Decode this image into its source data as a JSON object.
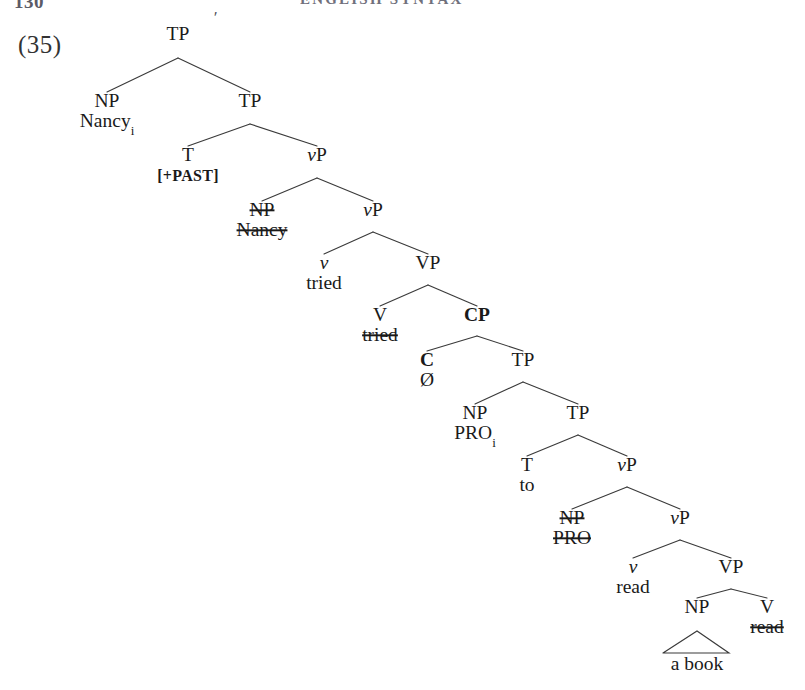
{
  "page": {
    "folio": "130",
    "running_title": "ENGLISH SYNTAX",
    "example_number": "(35)",
    "stray_mark": "'"
  },
  "tree": {
    "type": "syntax-tree",
    "description": "X-bar phrase structure tree for 'Nancy tried to read a book' with control PRO",
    "nodes": [
      {
        "id": "tp-root",
        "label": "TP",
        "sub": "",
        "gloss": "",
        "x": 178,
        "y": 40,
        "style": "plain"
      },
      {
        "id": "np-subj",
        "label": "NP",
        "sub": "",
        "gloss": "Nancy",
        "gloss_sub": "i",
        "x": 107,
        "y": 107,
        "style": "plain"
      },
      {
        "id": "tp-2",
        "label": "TP",
        "sub": "",
        "gloss": "",
        "x": 250,
        "y": 107,
        "style": "plain"
      },
      {
        "id": "t-past",
        "label": "T",
        "sub": "",
        "gloss": "[+PAST]",
        "x": 188,
        "y": 161,
        "style": "plain",
        "gloss_style": "smallcaps"
      },
      {
        "id": "vp-1",
        "label": "vP",
        "sub": "",
        "gloss": "",
        "x": 317,
        "y": 161,
        "style": "little-v"
      },
      {
        "id": "np-trace-1",
        "label": "NP",
        "sub": "",
        "gloss": "Nancy",
        "x": 262,
        "y": 216,
        "style": "struck",
        "gloss_style": "struck"
      },
      {
        "id": "vp-2",
        "label": "vP",
        "sub": "",
        "gloss": "",
        "x": 373,
        "y": 216,
        "style": "little-v"
      },
      {
        "id": "v-tried",
        "label": "v",
        "sub": "",
        "gloss": "tried",
        "x": 324,
        "y": 269,
        "style": "ital"
      },
      {
        "id": "vp-big",
        "label": "VP",
        "sub": "",
        "gloss": "",
        "x": 428,
        "y": 269,
        "style": "plain"
      },
      {
        "id": "v-trace",
        "label": "V",
        "sub": "",
        "gloss": "tried",
        "x": 380,
        "y": 321,
        "style": "plain",
        "gloss_style": "struck"
      },
      {
        "id": "cp",
        "label": "CP",
        "sub": "",
        "gloss": "",
        "x": 477,
        "y": 321,
        "style": "bold"
      },
      {
        "id": "c-null",
        "label": "C",
        "sub": "",
        "gloss": "Ø",
        "x": 427,
        "y": 366,
        "style": "bold"
      },
      {
        "id": "tp-3",
        "label": "TP",
        "sub": "",
        "gloss": "",
        "x": 523,
        "y": 366,
        "style": "plain"
      },
      {
        "id": "np-pro",
        "label": "NP",
        "sub": "",
        "gloss": "PRO",
        "gloss_sub": "i",
        "x": 475,
        "y": 419,
        "style": "plain"
      },
      {
        "id": "tp-4",
        "label": "TP",
        "sub": "",
        "gloss": "",
        "x": 578,
        "y": 419,
        "style": "plain"
      },
      {
        "id": "t-to",
        "label": "T",
        "sub": "",
        "gloss": "to",
        "x": 527,
        "y": 471,
        "style": "plain"
      },
      {
        "id": "vp-3",
        "label": "vP",
        "sub": "",
        "gloss": "",
        "x": 627,
        "y": 471,
        "style": "little-v"
      },
      {
        "id": "np-trace-2",
        "label": "NP",
        "sub": "",
        "gloss": "PRO",
        "x": 572,
        "y": 524,
        "style": "struck",
        "gloss_style": "struck"
      },
      {
        "id": "vp-4",
        "label": "vP",
        "sub": "",
        "gloss": "",
        "x": 680,
        "y": 524,
        "style": "little-v"
      },
      {
        "id": "v-read",
        "label": "v",
        "sub": "",
        "gloss": "read",
        "x": 633,
        "y": 573,
        "style": "ital"
      },
      {
        "id": "vp-read",
        "label": "VP",
        "sub": "",
        "gloss": "",
        "x": 731,
        "y": 573,
        "style": "plain"
      },
      {
        "id": "np-book",
        "label": "NP",
        "sub": "",
        "gloss": "",
        "x": 697,
        "y": 613,
        "style": "plain"
      },
      {
        "id": "v-read-trace",
        "label": "V",
        "sub": "",
        "gloss": "read",
        "x": 767,
        "y": 613,
        "style": "plain",
        "gloss_style": "struck"
      }
    ],
    "branches": [
      {
        "from": "tp-root",
        "apex_y": 58,
        "children": [
          "np-subj",
          "tp-2"
        ]
      },
      {
        "from": "tp-2",
        "apex_y": 124,
        "children": [
          "t-past",
          "vp-1"
        ]
      },
      {
        "from": "vp-1",
        "apex_y": 178,
        "children": [
          "np-trace-1",
          "vp-2"
        ]
      },
      {
        "from": "vp-2",
        "apex_y": 232,
        "children": [
          "v-tried",
          "vp-big"
        ]
      },
      {
        "from": "vp-big",
        "apex_y": 285,
        "children": [
          "v-trace",
          "cp"
        ]
      },
      {
        "from": "cp",
        "apex_y": 336,
        "children": [
          "c-null",
          "tp-3"
        ]
      },
      {
        "from": "tp-3",
        "apex_y": 382,
        "children": [
          "np-pro",
          "tp-4"
        ]
      },
      {
        "from": "tp-4",
        "apex_y": 435,
        "children": [
          "t-to",
          "vp-3"
        ]
      },
      {
        "from": "vp-3",
        "apex_y": 487,
        "children": [
          "np-trace-2",
          "vp-4"
        ]
      },
      {
        "from": "vp-4",
        "apex_y": 540,
        "children": [
          "v-read",
          "vp-read"
        ]
      },
      {
        "from": "vp-read",
        "apex_y": 589,
        "children": [
          "np-book",
          "v-read-trace"
        ]
      }
    ],
    "triangles": [
      {
        "id": "triangle-a-book",
        "parent": "np-book",
        "apex_x": 697,
        "apex_y": 631,
        "left_x": 663,
        "right_x": 729,
        "base_y": 653,
        "gloss": "a book",
        "gloss_x": 697,
        "gloss_y": 670
      }
    ]
  },
  "colors": {
    "ink": "#1a1a1a",
    "rule": "#3a3a3a",
    "paper": "#ffffff",
    "header": "#70707c"
  }
}
